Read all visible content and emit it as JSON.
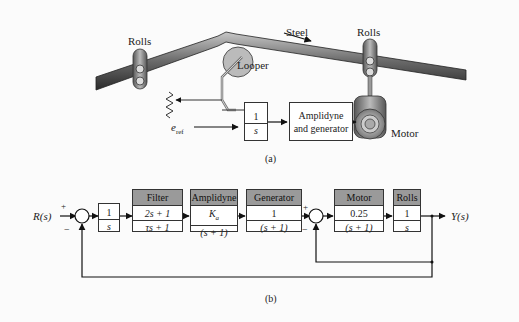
{
  "figure_a": {
    "labels": {
      "rolls_left": "Rolls",
      "rolls_right": "Rolls",
      "steel": "Steel",
      "looper": "Looper",
      "motor": "Motor",
      "e_ref": "e",
      "e_ref_sub": "ref"
    },
    "integrator": {
      "num": "1",
      "den": "s"
    },
    "amplidyne_block": {
      "line1": "Amplidyne",
      "line2": "and generator"
    },
    "caption": "(a)"
  },
  "figure_b": {
    "input": "R(s)",
    "output": "Y(s)",
    "sum1": {
      "plus": "+",
      "minus": "−"
    },
    "sum2": {
      "plus": "+",
      "minus": "−"
    },
    "blocks": [
      {
        "title": "",
        "num": "1",
        "den": "s"
      },
      {
        "title": "Filter",
        "num": "2s + 1",
        "den": "τs + 1"
      },
      {
        "title": "Amplidyne",
        "num": "K",
        "num_sub": "a",
        "den": "(s + 1)"
      },
      {
        "title": "Generator",
        "num": "1",
        "den": "(s + 1)"
      },
      {
        "title": "Motor",
        "num": "0.25",
        "den": "(s + 1)"
      },
      {
        "title": "Rolls",
        "num": "1",
        "den": "s"
      }
    ],
    "caption": "(b)"
  }
}
